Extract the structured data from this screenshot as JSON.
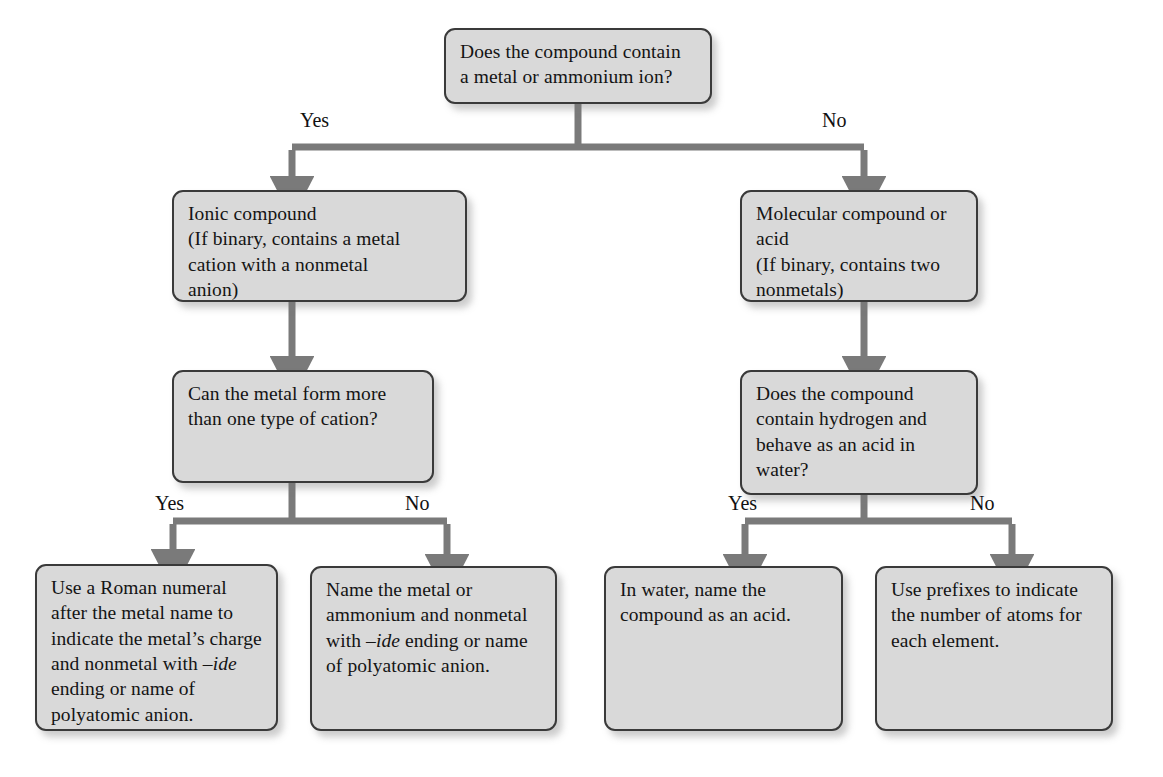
{
  "diagram": {
    "colors": {
      "box_fill": "#d9d9d9",
      "box_border": "#3a3a3a",
      "connector": "#7a7a7a",
      "text": "#141414",
      "background": "#ffffff"
    },
    "nodes": {
      "root": {
        "id": "root",
        "type": "decision",
        "lines": [
          "Does the compound contain",
          "a metal or ammonium ion?"
        ]
      },
      "ionic": {
        "id": "ionic",
        "type": "result",
        "lines": [
          "Ionic compound",
          "(If binary, contains a metal",
          "cation with a nonmetal",
          "anion)"
        ]
      },
      "molecular": {
        "id": "molecular",
        "type": "result",
        "lines": [
          "Molecular compound or",
          "acid",
          "(If binary, contains two",
          "nonmetals)"
        ]
      },
      "metal_cation_q": {
        "id": "metal_cation_q",
        "type": "decision",
        "lines": [
          "Can the metal form more",
          "than one type of cation?"
        ]
      },
      "acid_q": {
        "id": "acid_q",
        "type": "decision",
        "lines": [
          "Does the compound",
          "contain hydrogen and",
          "behave as an acid in",
          "water?"
        ]
      },
      "roman_numeral": {
        "id": "roman_numeral",
        "type": "terminal",
        "lines_rich": [
          [
            {
              "t": "Use a Roman numeral",
              "i": false
            }
          ],
          [
            {
              "t": "after the metal name to",
              "i": false
            }
          ],
          [
            {
              "t": "indicate the metal’s charge",
              "i": false
            }
          ],
          [
            {
              "t": "and nonmetal with ",
              "i": false
            },
            {
              "t": "–ide",
              "i": true
            }
          ],
          [
            {
              "t": "ending or name of",
              "i": false
            }
          ],
          [
            {
              "t": "polyatomic anion.",
              "i": false
            }
          ]
        ]
      },
      "name_metal": {
        "id": "name_metal",
        "type": "terminal",
        "lines_rich": [
          [
            {
              "t": "Name the metal or",
              "i": false
            }
          ],
          [
            {
              "t": "ammonium and nonmetal",
              "i": false
            }
          ],
          [
            {
              "t": "with ",
              "i": false
            },
            {
              "t": "–ide",
              "i": true
            },
            {
              "t": " ending or name",
              "i": false
            }
          ],
          [
            {
              "t": "of polyatomic anion.",
              "i": false
            }
          ]
        ]
      },
      "acid_name": {
        "id": "acid_name",
        "type": "terminal",
        "lines_rich": [
          [
            {
              "t": "In water, name the",
              "i": false
            }
          ],
          [
            {
              "t": "compound as an acid.",
              "i": false
            }
          ]
        ]
      },
      "prefixes": {
        "id": "prefixes",
        "type": "terminal",
        "lines_rich": [
          [
            {
              "t": "Use prefixes to indicate",
              "i": false
            }
          ],
          [
            {
              "t": "the number of atoms for",
              "i": false
            }
          ],
          [
            {
              "t": "each element.",
              "i": false
            }
          ]
        ]
      }
    },
    "branch_labels": {
      "root_yes": "Yes",
      "root_no": "No",
      "left_yes": "Yes",
      "left_no": "No",
      "right_yes": "Yes",
      "right_no": "No"
    }
  }
}
